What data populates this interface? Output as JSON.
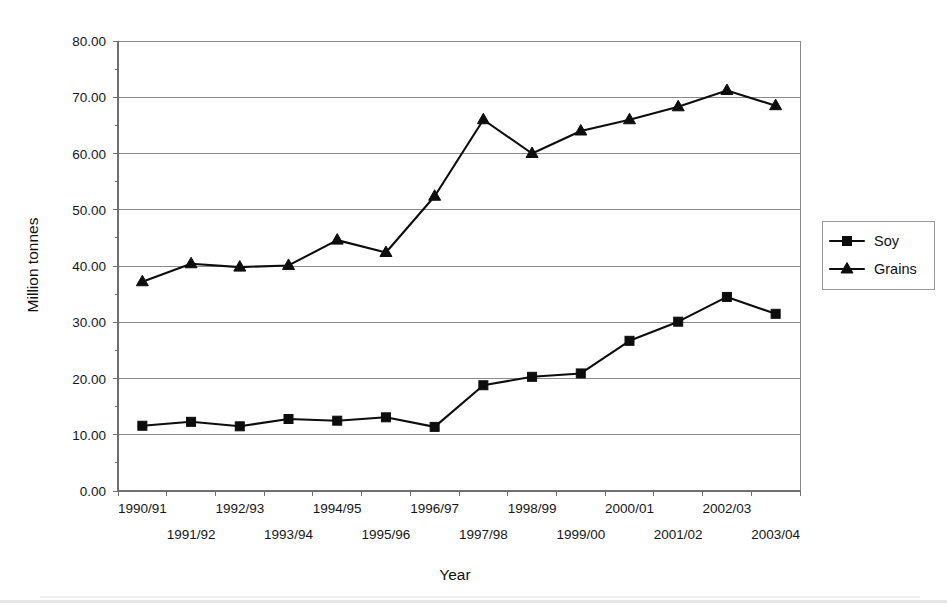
{
  "chart_data": {
    "type": "line",
    "title": "",
    "xlabel": "Year",
    "ylabel": "Million tonnes",
    "categories": [
      "1990/91",
      "1991/92",
      "1992/93",
      "1993/94",
      "1994/95",
      "1995/96",
      "1996/97",
      "1997/98",
      "1998/99",
      "1999/00",
      "2000/01",
      "2001/02",
      "2002/03",
      "2003/04"
    ],
    "series": [
      {
        "name": "Soy",
        "marker": "square",
        "color": "#0d0d0d",
        "values": [
          11.6,
          12.3,
          11.5,
          12.8,
          12.5,
          13.1,
          11.4,
          18.8,
          20.3,
          20.9,
          26.7,
          30.1,
          34.5,
          31.5
        ]
      },
      {
        "name": "Grains",
        "marker": "triangle",
        "color": "#0d0d0d",
        "values": [
          37.2,
          40.4,
          39.8,
          40.1,
          44.6,
          42.4,
          52.4,
          66.0,
          60.0,
          64.0,
          66.0,
          68.3,
          71.2,
          68.5
        ]
      }
    ],
    "ylim": [
      0,
      80
    ],
    "yticks": [
      0,
      10,
      20,
      30,
      40,
      50,
      60,
      70,
      80
    ],
    "ytick_labels": [
      "0.00",
      "10.00",
      "20.00",
      "30.00",
      "40.00",
      "50.00",
      "60.00",
      "70.00",
      "80.00"
    ],
    "grid": true,
    "grid_axis": "y",
    "legend_position": "right",
    "xtick_labels_staggered": true
  },
  "legend": {
    "entries": [
      {
        "label": "Soy",
        "marker": "square-marker"
      },
      {
        "label": "Grains",
        "marker": "triangle-marker"
      }
    ]
  },
  "axes": {
    "y_title": "Million tonnes",
    "x_title": "Year"
  }
}
